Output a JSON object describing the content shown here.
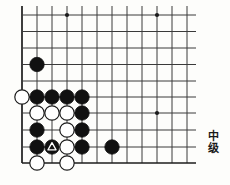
{
  "figure": {
    "kind": "go-problem-diagram",
    "rank_label": {
      "char1": "中",
      "char2": "级",
      "full": "中级"
    }
  },
  "board": {
    "line_color": "#3a3a3a",
    "edge_line_color": "#1c1c1c",
    "background": "#fdfdfb",
    "black_stone_color": "#111111",
    "white_stone_color": "#ffffff",
    "white_stone_outline": "#1c1c1c",
    "mark_color": "#ffffff",
    "cell_size": 15.2,
    "origin_x": 22,
    "origin_y": 15,
    "cols": 12,
    "rows": 10,
    "col_x": [
      22,
      37,
      52,
      67,
      82,
      97,
      112,
      127,
      142,
      157,
      172,
      187
    ],
    "row_y": [
      15,
      31.5,
      48,
      64.5,
      81,
      97,
      113,
      130,
      147,
      163
    ],
    "edges": {
      "left": true,
      "bottom": true,
      "top": false,
      "right": false
    },
    "star_points": [
      {
        "col": 3,
        "row": 0
      },
      {
        "col": 9,
        "row": 0
      },
      {
        "col": 9,
        "row": 6
      }
    ],
    "stones": [
      {
        "color": "black",
        "col": 1,
        "row": 3,
        "mark": null,
        "name": "black-stone-b4"
      },
      {
        "color": "white",
        "col": 0,
        "row": 5,
        "mark": null,
        "name": "white-stone-a6"
      },
      {
        "color": "black",
        "col": 1,
        "row": 5,
        "mark": null,
        "name": "black-stone-b6"
      },
      {
        "color": "black",
        "col": 2,
        "row": 5,
        "mark": null,
        "name": "black-stone-c6"
      },
      {
        "color": "black",
        "col": 3,
        "row": 5,
        "mark": null,
        "name": "black-stone-d6"
      },
      {
        "color": "black",
        "col": 4,
        "row": 5,
        "mark": null,
        "name": "black-stone-e6"
      },
      {
        "color": "white",
        "col": 1,
        "row": 6,
        "mark": null,
        "name": "white-stone-b7"
      },
      {
        "color": "white",
        "col": 2,
        "row": 6,
        "mark": null,
        "name": "white-stone-c7"
      },
      {
        "color": "white",
        "col": 3,
        "row": 6,
        "mark": null,
        "name": "white-stone-d7"
      },
      {
        "color": "black",
        "col": 4,
        "row": 6,
        "mark": null,
        "name": "black-stone-e7"
      },
      {
        "color": "black",
        "col": 1,
        "row": 7,
        "mark": null,
        "name": "black-stone-b8"
      },
      {
        "color": "white",
        "col": 3,
        "row": 7,
        "mark": null,
        "name": "white-stone-d8"
      },
      {
        "color": "black",
        "col": 4,
        "row": 7,
        "mark": null,
        "name": "black-stone-e8"
      },
      {
        "color": "black",
        "col": 1,
        "row": 8,
        "mark": null,
        "name": "black-stone-b9"
      },
      {
        "color": "black",
        "col": 2,
        "row": 8,
        "mark": "triangle",
        "name": "black-stone-marked-c9"
      },
      {
        "color": "white",
        "col": 3,
        "row": 8,
        "mark": null,
        "name": "white-stone-d9"
      },
      {
        "color": "black",
        "col": 4,
        "row": 8,
        "mark": null,
        "name": "black-stone-e9"
      },
      {
        "color": "black",
        "col": 6,
        "row": 8,
        "mark": null,
        "name": "black-stone-g9"
      },
      {
        "color": "white",
        "col": 1,
        "row": 9,
        "mark": null,
        "name": "white-stone-b10"
      },
      {
        "color": "white",
        "col": 3,
        "row": 9,
        "mark": null,
        "name": "white-stone-d10"
      }
    ]
  }
}
